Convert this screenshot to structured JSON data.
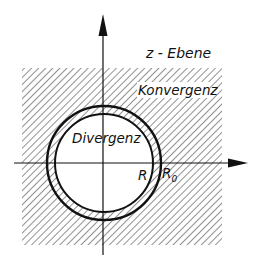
{
  "diagram": {
    "type": "complex-plane-region-of-convergence",
    "plane_label": "z - Ebene",
    "outer_region_label": "Konvergenz",
    "inner_region_label": "Divergenz",
    "inner_radius_label": "R",
    "outer_radius_label": "R",
    "outer_radius_subscript": "0",
    "colors": {
      "ink": "#111111",
      "hatch": "#555555",
      "background": "#ffffff"
    }
  }
}
